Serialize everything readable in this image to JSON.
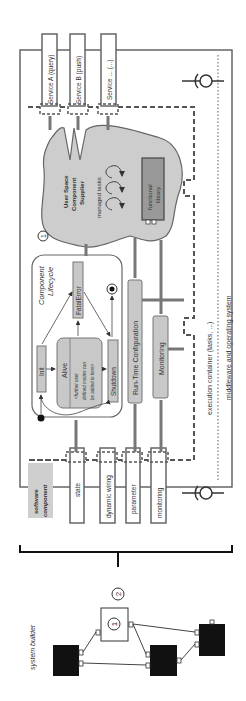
{
  "diagram": {
    "orientation": "rotated-90-ccw",
    "colors": {
      "box_fill": "#c8c8c8",
      "box_stroke": "#777777",
      "outline": "#666666",
      "dark_block": "#111111",
      "label_bg": "#cfcfcf",
      "cloud_fill": "#cdcdcd",
      "text": "#333333"
    },
    "services": [
      {
        "label": "Service A (query)"
      },
      {
        "label": "Service B (push)"
      },
      {
        "label": "Service ... (...)"
      }
    ],
    "ports": [
      {
        "label": "state"
      },
      {
        "label": "dynamic wiring"
      },
      {
        "label": "parameter"
      },
      {
        "label": "monitoring"
      }
    ],
    "software_component_label": [
      "software",
      "component"
    ],
    "supplier": {
      "title": [
        "User Space",
        "Component",
        "Supplier"
      ],
      "managed_tasks": "managed tasks",
      "functional_library": [
        "functional",
        "library"
      ],
      "marker": "1"
    },
    "lifecycle": {
      "title": [
        "Component",
        "Lifecycle"
      ],
      "states": {
        "init": "Init",
        "alive": "Alive",
        "alive_note": [
          "<further user",
          "defined modes can",
          "be added in here>"
        ],
        "fatal_error": "FatalError",
        "shutdown": "Shutdown"
      }
    },
    "run_time_configuration": "Run-Time Configuration",
    "monitoring": "Monitoring",
    "execution_container": "execution container (tasks, ...)",
    "middleware": "middleware and operating system",
    "system_builder": {
      "label": "system builder",
      "marker_outer": "2",
      "marker_inner": "1"
    }
  }
}
